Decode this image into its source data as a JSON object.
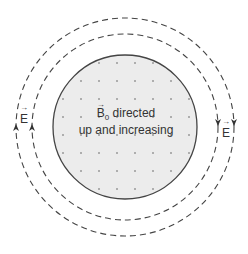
{
  "diagram": {
    "type": "induced electric field around changing magnetic field",
    "center_label": {
      "symbol": "B",
      "subscript": "0",
      "line1_rest": " directed",
      "line2": "up and increasing"
    },
    "field_labels": {
      "left": "E",
      "right": "E"
    },
    "circles": {
      "solid_radius": 72,
      "dashed_radii": [
        93,
        109
      ]
    },
    "arrows": {
      "left": "up",
      "right": "down"
    },
    "colors": {
      "fill": "#ececec",
      "dots": "#9a9a9a",
      "stroke": "#444444"
    }
  }
}
